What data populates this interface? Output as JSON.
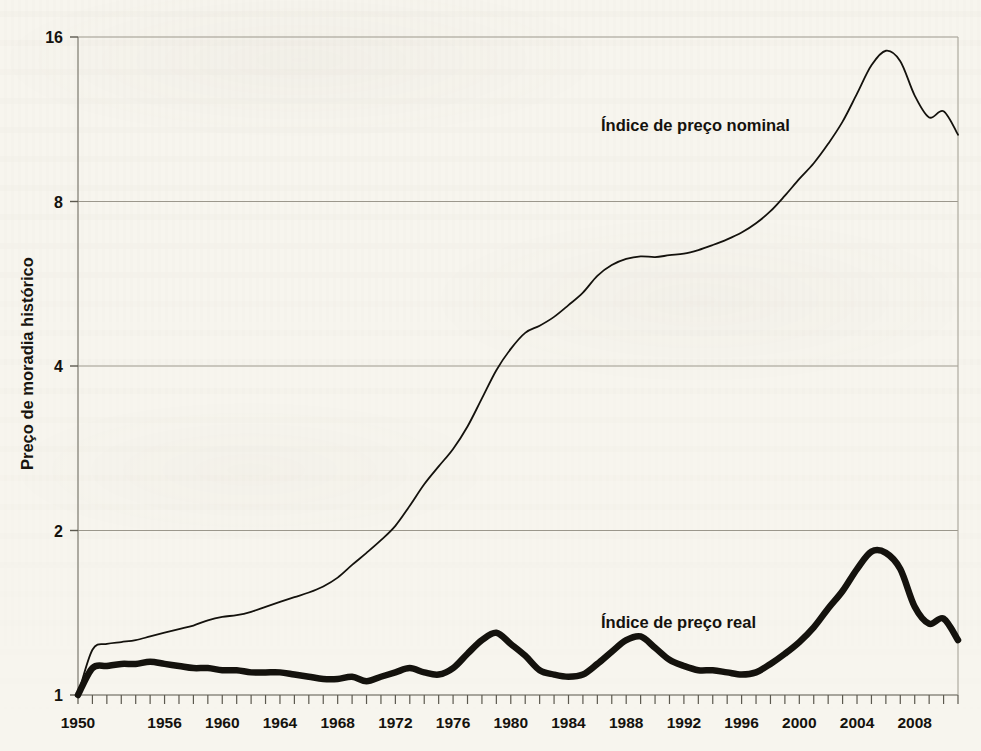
{
  "chart_data": {
    "type": "line",
    "title": "",
    "xlabel": "",
    "ylabel": "Preço de moradia histórico",
    "y_scale": "log2",
    "ylim": [
      1,
      16
    ],
    "yticks": [
      1,
      2,
      4,
      8,
      16
    ],
    "ytick_labels": [
      "1",
      "2",
      "4",
      "8",
      "16"
    ],
    "grid": true,
    "legend_position": "inline-annotation",
    "xlim": [
      1950,
      2011
    ],
    "xtick_labels": [
      "1950",
      "1956",
      "1960",
      "1964",
      "1968",
      "1972",
      "1976",
      "1980",
      "1984",
      "1988",
      "1992",
      "1996",
      "2000",
      "2004",
      "2008"
    ],
    "xticks": [
      1950,
      1956,
      1960,
      1964,
      1968,
      1972,
      1976,
      1980,
      1984,
      1988,
      1992,
      1996,
      2000,
      2004,
      2008
    ],
    "minor_xtick_interval": 1,
    "annotations": [
      {
        "text": "Índice de preço nominal",
        "x": 1991,
        "y": 11.2
      },
      {
        "text": "Índice de preço real",
        "x": 1995,
        "y": 1.45
      }
    ],
    "series": [
      {
        "name": "Índice de preço nominal",
        "color": "#14120d",
        "line_width": 1.8,
        "x": [
          1950,
          1951,
          1952,
          1953,
          1954,
          1955,
          1956,
          1957,
          1958,
          1959,
          1960,
          1961,
          1962,
          1963,
          1964,
          1965,
          1966,
          1967,
          1968,
          1969,
          1970,
          1971,
          1972,
          1973,
          1974,
          1975,
          1976,
          1977,
          1978,
          1979,
          1980,
          1981,
          1982,
          1983,
          1984,
          1985,
          1986,
          1987,
          1988,
          1989,
          1990,
          1991,
          1992,
          1993,
          1994,
          1995,
          1996,
          1997,
          1998,
          1999,
          2000,
          2001,
          2002,
          2003,
          2004,
          2005,
          2006,
          2007,
          2008,
          2009,
          2010,
          2011
        ],
        "values": [
          1.0,
          1.21,
          1.24,
          1.25,
          1.26,
          1.28,
          1.3,
          1.32,
          1.34,
          1.37,
          1.39,
          1.4,
          1.42,
          1.45,
          1.48,
          1.51,
          1.54,
          1.58,
          1.64,
          1.73,
          1.82,
          1.92,
          2.04,
          2.22,
          2.43,
          2.62,
          2.82,
          3.1,
          3.49,
          3.93,
          4.3,
          4.6,
          4.74,
          4.92,
          5.17,
          5.45,
          5.85,
          6.12,
          6.28,
          6.35,
          6.33,
          6.38,
          6.42,
          6.52,
          6.66,
          6.82,
          7.02,
          7.3,
          7.68,
          8.2,
          8.8,
          9.4,
          10.2,
          11.2,
          12.6,
          14.2,
          15.1,
          14.45,
          12.5,
          11.4,
          11.7,
          10.6
        ]
      },
      {
        "name": "Índice de preço real",
        "color": "#14120d",
        "line_width": 6.5,
        "x": [
          1950,
          1951,
          1952,
          1953,
          1954,
          1955,
          1956,
          1957,
          1958,
          1959,
          1960,
          1961,
          1962,
          1963,
          1964,
          1965,
          1966,
          1967,
          1968,
          1969,
          1970,
          1971,
          1972,
          1973,
          1974,
          1975,
          1976,
          1977,
          1978,
          1979,
          1980,
          1981,
          1982,
          1983,
          1984,
          1985,
          1986,
          1987,
          1988,
          1989,
          1990,
          1991,
          1992,
          1993,
          1994,
          1995,
          1996,
          1997,
          1998,
          1999,
          2000,
          2001,
          2002,
          2003,
          2004,
          2005,
          2006,
          2007,
          2008,
          2009,
          2010,
          2011
        ],
        "values": [
          1.0,
          1.12,
          1.13,
          1.14,
          1.14,
          1.15,
          1.14,
          1.13,
          1.12,
          1.12,
          1.11,
          1.11,
          1.1,
          1.1,
          1.1,
          1.09,
          1.08,
          1.07,
          1.07,
          1.08,
          1.06,
          1.08,
          1.1,
          1.12,
          1.1,
          1.09,
          1.12,
          1.19,
          1.26,
          1.3,
          1.24,
          1.18,
          1.11,
          1.09,
          1.08,
          1.09,
          1.14,
          1.2,
          1.26,
          1.28,
          1.22,
          1.16,
          1.13,
          1.11,
          1.11,
          1.1,
          1.09,
          1.1,
          1.14,
          1.19,
          1.25,
          1.33,
          1.44,
          1.55,
          1.7,
          1.83,
          1.82,
          1.7,
          1.45,
          1.35,
          1.38,
          1.26
        ]
      }
    ]
  },
  "axis": {
    "y_label": "Preço de moradia histórico",
    "y_ticks": [
      "16",
      "8",
      "4",
      "2",
      "1"
    ],
    "x_ticks": [
      "1950",
      "1956",
      "1960",
      "1964",
      "1968",
      "1972",
      "1976",
      "1980",
      "1984",
      "1988",
      "1992",
      "1996",
      "2000",
      "2004",
      "2008"
    ]
  },
  "annotations": {
    "nominal": "Índice de preço nominal",
    "real": "Índice de preço real"
  },
  "colors": {
    "page_background": "#f7f5ee",
    "ink": "#14120d",
    "grid": "#9b978c",
    "axis": "#8d8a80"
  }
}
